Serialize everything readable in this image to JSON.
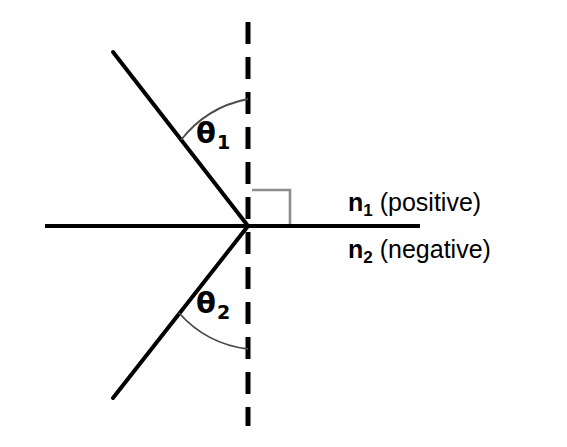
{
  "figure": {
    "type": "optics-refraction-diagram",
    "background_color": "#ffffff",
    "line_color": "#000000",
    "arc_color": "#555555",
    "right_angle_color": "#888888"
  },
  "labels": {
    "theta1": {
      "symbol": "θ",
      "subscript": "1"
    },
    "theta2": {
      "symbol": "θ",
      "subscript": "2"
    },
    "medium_upper": {
      "symbol": "n",
      "subscript": "1",
      "description": "(positive)"
    },
    "medium_lower": {
      "symbol": "n",
      "subscript": "2",
      "description": "(negative)"
    }
  },
  "geometry": {
    "vertex": {
      "x": 248,
      "y": 226
    },
    "interface_line": {
      "x1": 45,
      "y1": 226,
      "x2": 420,
      "y2": 226
    },
    "normal_dashed_line": {
      "x": 248,
      "y1": 22,
      "y2": 426,
      "dash": 22,
      "gap": 13
    },
    "incident_ray": {
      "x1": 113,
      "y1": 52,
      "x2": 248,
      "y2": 226
    },
    "refracted_ray": {
      "x1": 248,
      "y1": 226,
      "x2": 113,
      "y2": 398
    },
    "right_angle_marker": {
      "x1": 252,
      "y1": 190,
      "x2": 290,
      "y2": 226
    },
    "theta1_arc": {
      "start_x": 182,
      "start_y": 141,
      "end_x": 248,
      "end_y": 100
    },
    "theta2_arc": {
      "start_x": 180,
      "start_y": 312,
      "end_x": 248,
      "end_y": 348
    }
  }
}
